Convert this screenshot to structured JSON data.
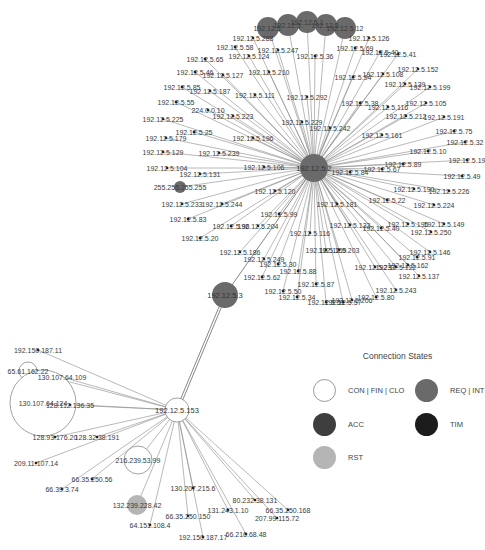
{
  "colors": {
    "con_fin_clo": "#ffffff",
    "req_int": "#6a6a6a",
    "acc": "#3e3e3e",
    "tim": "#1c1c1c",
    "rst": "#b5b5b5",
    "edge": "#8a8a8a"
  },
  "legend": {
    "title": "Connection States",
    "items": [
      {
        "label": "CON | FIN | CLO",
        "state": "con_fin_clo"
      },
      {
        "label": "REQ | INT",
        "state": "req_int"
      },
      {
        "label": "ACC",
        "state": "acc"
      },
      {
        "label": "TIM",
        "state": "tim"
      },
      {
        "label": "RST",
        "state": "rst"
      }
    ]
  },
  "hubs": [
    {
      "id": "hub1",
      "label": "192.12.5.2",
      "x": 314,
      "y": 168,
      "r": 14,
      "state": "req_int"
    },
    {
      "id": "hub2",
      "label": "192.12.5.3",
      "x": 225,
      "y": 295,
      "r": 13,
      "state": "req_int"
    },
    {
      "id": "hub3",
      "label": "192.12.5.153",
      "x": 177,
      "y": 410,
      "r": 12,
      "state": "con_fin_clo"
    }
  ],
  "top_cluster": [
    {
      "label": "192.12.5.",
      "x": 268,
      "y": 28,
      "r": 11
    },
    {
      "label": "192.12.5.",
      "x": 288,
      "y": 25,
      "r": 11
    },
    {
      "label": "192.12.5.1",
      "x": 307,
      "y": 22,
      "r": 11
    },
    {
      "label": "192.12.5.",
      "x": 326,
      "y": 25,
      "r": 11
    },
    {
      "label": "192.12.5.12",
      "x": 345,
      "y": 28,
      "r": 11
    }
  ],
  "hub1_leaves": [
    {
      "label": "192.12.5.126",
      "x": 369,
      "y": 38
    },
    {
      "label": "192.12.5.288",
      "x": 253,
      "y": 38
    },
    {
      "label": "192.12.5.58",
      "x": 235,
      "y": 47
    },
    {
      "label": "192.12.5.247",
      "x": 278,
      "y": 50
    },
    {
      "label": "192.12.5.36",
      "x": 315,
      "y": 56
    },
    {
      "label": "192.12.5.69",
      "x": 355,
      "y": 48
    },
    {
      "label": "192.12.5.40",
      "x": 380,
      "y": 52
    },
    {
      "label": "192.12.5.41",
      "x": 398,
      "y": 54
    },
    {
      "label": "192.12.5.65",
      "x": 205,
      "y": 59
    },
    {
      "label": "192.12.5.124",
      "x": 249,
      "y": 56
    },
    {
      "label": "192.12.5.152",
      "x": 418,
      "y": 69
    },
    {
      "label": "192.12.5.94",
      "x": 353,
      "y": 77
    },
    {
      "label": "192.12.5.108",
      "x": 383,
      "y": 74
    },
    {
      "label": "192.12.5.210",
      "x": 269,
      "y": 72
    },
    {
      "label": "192.12.5.46",
      "x": 195,
      "y": 72
    },
    {
      "label": "192.12.5.127",
      "x": 223,
      "y": 75
    },
    {
      "label": "192.12.5.139",
      "x": 405,
      "y": 84
    },
    {
      "label": "192.12.5.199",
      "x": 430,
      "y": 87
    },
    {
      "label": "192.12.5.85",
      "x": 182,
      "y": 87
    },
    {
      "label": "192.12.5.187",
      "x": 210,
      "y": 91
    },
    {
      "label": "192.12.5.111",
      "x": 255,
      "y": 95
    },
    {
      "label": "192.12.5.292",
      "x": 307,
      "y": 97
    },
    {
      "label": "192.12.5.38",
      "x": 360,
      "y": 103
    },
    {
      "label": "192.12.5.105",
      "x": 426,
      "y": 103
    },
    {
      "label": "192.12.5.116",
      "x": 388,
      "y": 107
    },
    {
      "label": "192.12.5.55",
      "x": 176,
      "y": 102
    },
    {
      "label": "224.0.0.10",
      "x": 208,
      "y": 110
    },
    {
      "label": "192.12.5.212",
      "x": 406,
      "y": 116
    },
    {
      "label": "192.12.5.191",
      "x": 444,
      "y": 117
    },
    {
      "label": "192.12.5.225",
      "x": 163,
      "y": 119
    },
    {
      "label": "192.12.5.223",
      "x": 233,
      "y": 116
    },
    {
      "label": "192.12.5.229",
      "x": 302,
      "y": 122
    },
    {
      "label": "192.12.5.75",
      "x": 454,
      "y": 131
    },
    {
      "label": "192.12.5.242",
      "x": 330,
      "y": 128
    },
    {
      "label": "192.12.5.161",
      "x": 382,
      "y": 135
    },
    {
      "label": "192.12.5.25",
      "x": 194,
      "y": 132
    },
    {
      "label": "192.12.5.179",
      "x": 166,
      "y": 138
    },
    {
      "label": "192.12.5.196",
      "x": 253,
      "y": 138
    },
    {
      "label": "192.12.5.32",
      "x": 465,
      "y": 142
    },
    {
      "label": "192.12.5.10",
      "x": 428,
      "y": 151
    },
    {
      "label": "192.12.5.129",
      "x": 163,
      "y": 152
    },
    {
      "label": "192.12.5.239",
      "x": 219,
      "y": 153
    },
    {
      "label": "192.12.5.19",
      "x": 467,
      "y": 160
    },
    {
      "label": "192.12.5.89",
      "x": 403,
      "y": 164
    },
    {
      "label": "192.12.5.67",
      "x": 382,
      "y": 169
    },
    {
      "label": "192.12.5.84",
      "x": 350,
      "y": 172
    },
    {
      "label": "192.12.5.104",
      "x": 167,
      "y": 168
    },
    {
      "label": "192.12.5.106",
      "x": 264,
      "y": 167
    },
    {
      "label": "192.12.5.131",
      "x": 200,
      "y": 174
    },
    {
      "label": "192.12.5.49",
      "x": 462,
      "y": 176
    },
    {
      "label": "255.255.255.255",
      "x": 180,
      "y": 187,
      "r": 6,
      "state": "req_int"
    },
    {
      "label": "192.12.5.120",
      "x": 275,
      "y": 191
    },
    {
      "label": "192.12.5.190",
      "x": 414,
      "y": 189
    },
    {
      "label": "192.12.5.226",
      "x": 449,
      "y": 191
    },
    {
      "label": "192.12.5.22",
      "x": 387,
      "y": 200
    },
    {
      "label": "192.12.5.224",
      "x": 434,
      "y": 205
    },
    {
      "label": "192.12.5.181",
      "x": 337,
      "y": 204
    },
    {
      "label": "192.12.5.233",
      "x": 182,
      "y": 204
    },
    {
      "label": "192.12.5.244",
      "x": 222,
      "y": 204
    },
    {
      "label": "192.12.5.99",
      "x": 279,
      "y": 214
    },
    {
      "label": "192.12.5.83",
      "x": 188,
      "y": 219
    },
    {
      "label": "192.12.5.96",
      "x": 231,
      "y": 226
    },
    {
      "label": "192.12.5.204",
      "x": 258,
      "y": 226
    },
    {
      "label": "192.12.5.195",
      "x": 408,
      "y": 224
    },
    {
      "label": "192.12.5.149",
      "x": 444,
      "y": 224
    },
    {
      "label": "192.12.5.133",
      "x": 350,
      "y": 225
    },
    {
      "label": "192.12.5.40",
      "x": 381,
      "y": 228
    },
    {
      "label": "192.12.5.250",
      "x": 431,
      "y": 232
    },
    {
      "label": "192.12.5.116",
      "x": 310,
      "y": 233
    },
    {
      "label": "192.12.5.20",
      "x": 200,
      "y": 238
    },
    {
      "label": "192.12.5.186",
      "x": 240,
      "y": 252
    },
    {
      "label": "192.12.5.249",
      "x": 264,
      "y": 259
    },
    {
      "label": "192.12.5.159",
      "x": 326,
      "y": 250
    },
    {
      "label": "192.12.5.203",
      "x": 339,
      "y": 250
    },
    {
      "label": "192.12.5.146",
      "x": 430,
      "y": 252
    },
    {
      "label": "192.12.5.91",
      "x": 417,
      "y": 257
    },
    {
      "label": "192.12.5.30",
      "x": 278,
      "y": 264
    },
    {
      "label": "192.12.5.88",
      "x": 298,
      "y": 271
    },
    {
      "label": "192.12.5.162",
      "x": 408,
      "y": 265
    },
    {
      "label": "192.12.5.62",
      "x": 262,
      "y": 277
    },
    {
      "label": "192.12.5.237",
      "x": 375,
      "y": 267
    },
    {
      "label": "192.12.5.122",
      "x": 396,
      "y": 267
    },
    {
      "label": "192.12.5.137",
      "x": 419,
      "y": 276
    },
    {
      "label": "192.12.5.87",
      "x": 316,
      "y": 284
    },
    {
      "label": "192.12.5.243",
      "x": 396,
      "y": 290
    },
    {
      "label": "192.12.5.50",
      "x": 283,
      "y": 291
    },
    {
      "label": "192.12.5.34",
      "x": 297,
      "y": 297
    },
    {
      "label": "192.12.5.80",
      "x": 376,
      "y": 297
    },
    {
      "label": "192.12.5.51",
      "x": 326,
      "y": 302
    },
    {
      "label": "192.12.5.206",
      "x": 352,
      "y": 300
    },
    {
      "label": "192.12.5.57",
      "x": 343,
      "y": 302
    }
  ],
  "hub3_leaves": [
    {
      "label": "192.150.187.11",
      "x": 38,
      "y": 350
    },
    {
      "label": "65.61.162.22",
      "x": 28,
      "y": 371,
      "r": 9,
      "state": "con_fin_clo"
    },
    {
      "label": "130.107.64.109",
      "x": 62,
      "y": 377
    },
    {
      "label": "130.107.64.124",
      "x": 43,
      "y": 403,
      "r": 33,
      "state": "con_fin_clo"
    },
    {
      "label": "128.112.136.35",
      "x": 70,
      "y": 405
    },
    {
      "label": "128.93.176.20",
      "x": 55,
      "y": 437
    },
    {
      "label": "128.32.38.191",
      "x": 97,
      "y": 437
    },
    {
      "label": "216.239.53.99",
      "x": 138,
      "y": 460,
      "r": 14,
      "state": "con_fin_clo"
    },
    {
      "label": "209.11.107.14",
      "x": 36,
      "y": 463
    },
    {
      "label": "66.35.250.56",
      "x": 92,
      "y": 479
    },
    {
      "label": "66.39.3.74",
      "x": 62,
      "y": 489
    },
    {
      "label": "132.239.228.42",
      "x": 137,
      "y": 505,
      "r": 10,
      "state": "rst"
    },
    {
      "label": "64.151.108.4",
      "x": 150,
      "y": 525
    },
    {
      "label": "130.207.215.6",
      "x": 193,
      "y": 488
    },
    {
      "label": "66.35.250.150",
      "x": 188,
      "y": 516
    },
    {
      "label": "192.150.187.17",
      "x": 203,
      "y": 537
    },
    {
      "label": "80.232.38.131",
      "x": 255,
      "y": 500
    },
    {
      "label": "131.243.1.10",
      "x": 228,
      "y": 510
    },
    {
      "label": "66.35.250.168",
      "x": 288,
      "y": 510
    },
    {
      "label": "207.99.115.72",
      "x": 277,
      "y": 518
    },
    {
      "label": "66.216.68.48",
      "x": 246,
      "y": 534
    }
  ]
}
